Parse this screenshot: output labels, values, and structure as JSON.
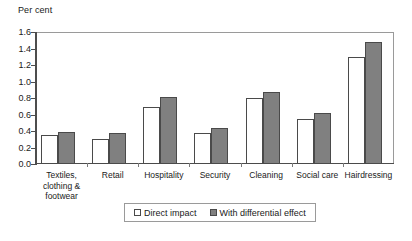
{
  "chart_data": {
    "type": "bar",
    "title": "",
    "subtitle": "",
    "xlabel": "",
    "ylabel": "Per cent",
    "ylim": [
      0.0,
      1.6
    ],
    "ytick_labels": [
      "1.6",
      "1.4",
      "1.2",
      "1.0",
      "0.8",
      "0.6",
      "0.4",
      "0.2",
      "0.0"
    ],
    "ytick_values": [
      1.6,
      1.4,
      1.2,
      1.0,
      0.8,
      0.6,
      0.4,
      0.2,
      0.0
    ],
    "grid": false,
    "legend_position": "bottom",
    "categories": [
      "Textiles,\nclothing &\nfootwear",
      "Retail",
      "Hospitality",
      "Security",
      "Cleaning",
      "Social care",
      "Hairdressing"
    ],
    "series": [
      {
        "name": "Direct impact",
        "color": "#ffffff",
        "values": [
          0.35,
          0.3,
          0.69,
          0.37,
          0.8,
          0.55,
          1.3
        ]
      },
      {
        "name": "With differential effect",
        "color": "#808080",
        "values": [
          0.39,
          0.38,
          0.81,
          0.44,
          0.87,
          0.62,
          1.48
        ]
      }
    ]
  },
  "legend": {
    "entries": [
      {
        "label": "Direct impact"
      },
      {
        "label": "With differential effect"
      }
    ]
  },
  "colors": {
    "direct_impact": "#ffffff",
    "differential_effect": "#808080",
    "bar_outline": "#4a4a4a",
    "axis": "#4d4d4d",
    "frame": "#9a9a9a",
    "text": "#1a1a1a",
    "background": "#ffffff"
  }
}
